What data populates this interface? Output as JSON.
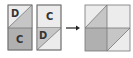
{
  "diagram": {
    "colors": {
      "light": "#ececec",
      "mid": "#c6c6c6",
      "dark": "#b0b0b0",
      "stroke": "#777777",
      "arrow": "#222222"
    },
    "panels": [
      {
        "id": "panel-1",
        "top_label": "D",
        "bottom_label": "C"
      },
      {
        "id": "panel-2",
        "top_label": "C",
        "bottom_label": "D"
      },
      {
        "id": "panel-result"
      }
    ],
    "arrow": "right-arrow"
  }
}
